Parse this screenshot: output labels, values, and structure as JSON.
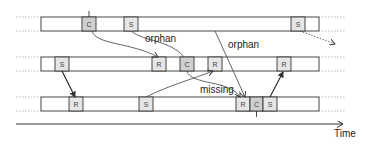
{
  "diagram": {
    "axis_label": "Time",
    "labels": {
      "orphan_1": "orphan",
      "orphan_2": "orphan",
      "missing": "missing"
    },
    "rows": [
      {
        "name": "process-1",
        "boxes": [
          {
            "label": "C",
            "type": "checkpoint"
          },
          {
            "label": "S",
            "type": "send"
          },
          {
            "label": "S",
            "type": "send"
          }
        ]
      },
      {
        "name": "process-2",
        "boxes": [
          {
            "label": "S",
            "type": "send"
          },
          {
            "label": "R",
            "type": "receive"
          },
          {
            "label": "C",
            "type": "checkpoint"
          },
          {
            "label": "R",
            "type": "receive"
          },
          {
            "label": "R",
            "type": "receive"
          }
        ]
      },
      {
        "name": "process-3",
        "boxes": [
          {
            "label": "R",
            "type": "receive"
          },
          {
            "label": "S",
            "type": "send"
          },
          {
            "label": "R",
            "type": "receive"
          },
          {
            "label": "C",
            "type": "checkpoint"
          },
          {
            "label": "S",
            "type": "send"
          }
        ]
      }
    ],
    "colors": {
      "box_fill": "#e6e6e6",
      "checkpoint_fill": "#cfcfcf",
      "line": "#333333",
      "dotted": "#999999"
    }
  }
}
